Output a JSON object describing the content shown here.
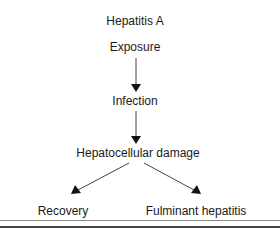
{
  "diagram": {
    "title": "Hepatitis A",
    "nodes": [
      {
        "id": "exposure",
        "label": "Exposure"
      },
      {
        "id": "infection",
        "label": "Infection"
      },
      {
        "id": "damage",
        "label": "Hepatocellular damage"
      },
      {
        "id": "recovery",
        "label": "Recovery"
      },
      {
        "id": "fulminant",
        "label": "Fulminant hepatitis"
      }
    ],
    "edges": [
      {
        "from": "exposure",
        "to": "infection"
      },
      {
        "from": "infection",
        "to": "damage"
      },
      {
        "from": "damage",
        "to": "recovery"
      },
      {
        "from": "damage",
        "to": "fulminant"
      }
    ],
    "colors": {
      "line": "#333333",
      "text": "#1a1a1a"
    }
  }
}
